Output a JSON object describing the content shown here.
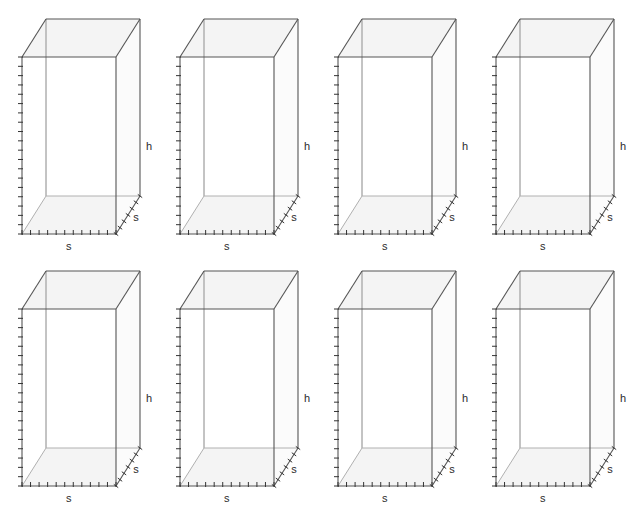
{
  "page": {
    "top_caption": "",
    "background_color": "#ffffff",
    "columns": 4,
    "rows": 2,
    "figure_count": 8
  },
  "figure": {
    "kind": "rectangular-prism-wireframe",
    "line_color": "#555555",
    "hidden_line_color": "#b0b0b0",
    "face_fill_color": "#f4f4f4",
    "label_color": "#2b2b2b",
    "tick_color": "#333333",
    "labels": {
      "height": "h",
      "side_width": "s",
      "side_depth": "s"
    },
    "ticks": {
      "vertical_count": 19,
      "bottom_count": 11,
      "depth_count": 6
    }
  },
  "figures": [
    {
      "id": 1,
      "label_h": "h",
      "label_s_bottom": "s",
      "label_s_depth": "s"
    },
    {
      "id": 2,
      "label_h": "h",
      "label_s_bottom": "s",
      "label_s_depth": "s"
    },
    {
      "id": 3,
      "label_h": "h",
      "label_s_bottom": "s",
      "label_s_depth": "s"
    },
    {
      "id": 4,
      "label_h": "h",
      "label_s_bottom": "s",
      "label_s_depth": "s"
    },
    {
      "id": 5,
      "label_h": "h",
      "label_s_bottom": "s",
      "label_s_depth": "s"
    },
    {
      "id": 6,
      "label_h": "h",
      "label_s_bottom": "s",
      "label_s_depth": "s"
    },
    {
      "id": 7,
      "label_h": "h",
      "label_s_bottom": "s",
      "label_s_depth": "s"
    },
    {
      "id": 8,
      "label_h": "h",
      "label_s_bottom": "s",
      "label_s_depth": "s"
    }
  ]
}
